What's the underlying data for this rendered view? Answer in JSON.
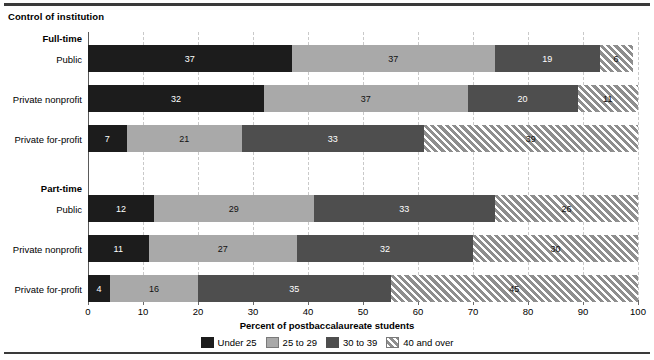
{
  "chart_title": "Control of institution",
  "axis_title": "Percent of postbaccalaureate students",
  "legend_position": "bottom-center",
  "groups": [
    {
      "heading": "Full-time"
    },
    {
      "heading": "Part-time"
    }
  ],
  "chart_data": {
    "type": "bar",
    "orientation": "horizontal",
    "stacked": true,
    "stack_total": 100,
    "title": "Control of institution",
    "xlabel": "Percent of postbaccalaureate students",
    "ylabel": "",
    "xlim": [
      0,
      100
    ],
    "xticks": [
      0,
      10,
      20,
      30,
      40,
      50,
      60,
      70,
      80,
      90,
      100
    ],
    "grid": true,
    "grid_axis": "x",
    "legend": [
      "Under 25",
      "25 to 29",
      "30 to 39",
      "40 and over"
    ],
    "series": [
      {
        "name": "Under 25",
        "color": "#1c1c1c",
        "pattern": "solid",
        "values": [
          37,
          32,
          7,
          12,
          11,
          4
        ]
      },
      {
        "name": "25 to 29",
        "color": "#a9a9a9",
        "pattern": "solid",
        "values": [
          37,
          37,
          21,
          29,
          27,
          16
        ]
      },
      {
        "name": "30 to 39",
        "color": "#4e4e4e",
        "pattern": "solid",
        "values": [
          19,
          20,
          33,
          33,
          32,
          35
        ]
      },
      {
        "name": "40 and over",
        "color": "#9a9a9a",
        "pattern": "diagonal-hatch",
        "values": [
          6,
          11,
          39,
          26,
          30,
          45
        ]
      }
    ],
    "categories": [
      "Full-time | Public",
      "Full-time | Private nonprofit",
      "Full-time | Private for-profit",
      "Part-time | Public",
      "Part-time | Private nonprofit",
      "Part-time | Private for-profit"
    ],
    "rows": [
      {
        "group": "Full-time",
        "label": "Public",
        "values": [
          37,
          37,
          19,
          6
        ]
      },
      {
        "group": "Full-time",
        "label": "Private nonprofit",
        "values": [
          32,
          37,
          20,
          11
        ]
      },
      {
        "group": "Full-time",
        "label": "Private for-profit",
        "values": [
          7,
          21,
          33,
          39
        ]
      },
      {
        "group": "Part-time",
        "label": "Public",
        "values": [
          12,
          29,
          33,
          26
        ]
      },
      {
        "group": "Part-time",
        "label": "Private nonprofit",
        "values": [
          11,
          27,
          32,
          30
        ]
      },
      {
        "group": "Part-time",
        "label": "Private for-profit",
        "values": [
          4,
          16,
          35,
          45
        ]
      }
    ]
  }
}
